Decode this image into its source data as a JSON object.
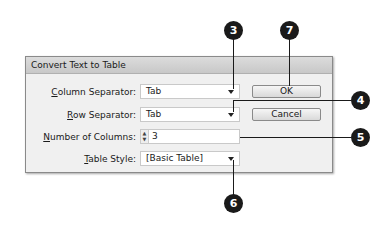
{
  "dialog": {
    "title": "Convert Text to Table",
    "fields": [
      {
        "label_prefix": "",
        "label_mnemonic": "C",
        "label_rest": "olumn Separator:",
        "value": "Tab",
        "type": "dropdown"
      },
      {
        "label_prefix": "",
        "label_mnemonic": "R",
        "label_rest": "ow Separator:",
        "value": "Tab",
        "type": "dropdown"
      },
      {
        "label_prefix": "",
        "label_mnemonic": "N",
        "label_rest": "umber of Columns:",
        "value": "3",
        "type": "stepper"
      },
      {
        "label_prefix": "",
        "label_mnemonic": "T",
        "label_rest": "able Style:",
        "value": "[Basic Table]",
        "type": "dropdown"
      }
    ],
    "buttons": {
      "ok": "OK",
      "cancel": "Cancel"
    },
    "spin_up": "▲",
    "spin_down": "▼"
  },
  "callouts": [
    "3",
    "7",
    "4",
    "5",
    "6"
  ]
}
